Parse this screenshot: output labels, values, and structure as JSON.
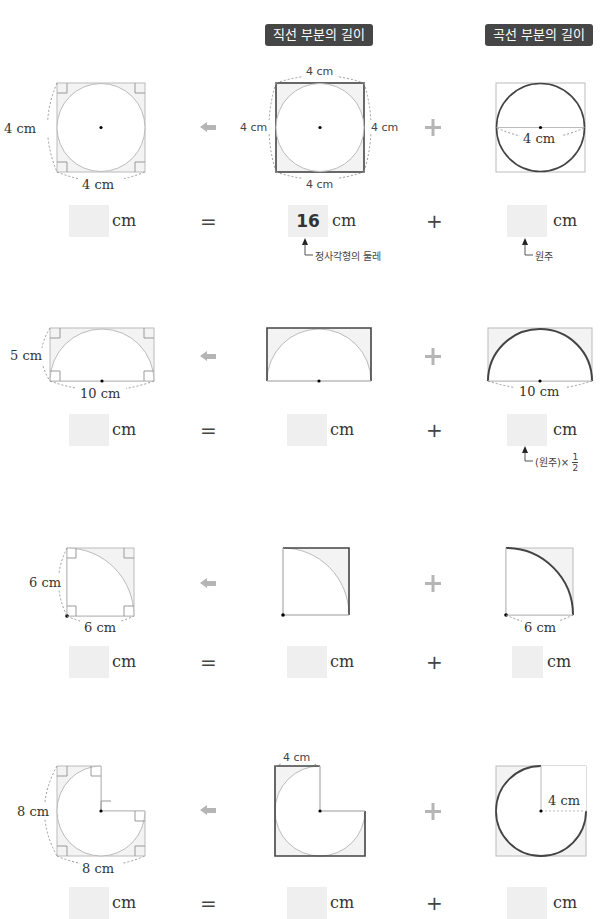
{
  "headers": {
    "straight": "직선 부분의 길이",
    "curved": "곡선 부분의 길이"
  },
  "rows": [
    {
      "shape": "circle-in-square",
      "labels": {
        "left_side": "4 cm",
        "left_bottom": "4 cm",
        "mid_top": "4 cm",
        "mid_left": "4 cm",
        "mid_right": "4 cm",
        "mid_bottom": "4 cm",
        "right_diameter": "4 cm"
      },
      "answer": {
        "total": "",
        "straight": "16",
        "curved": "",
        "unit": "cm"
      },
      "notes": {
        "straight": "정사각형의 둘레",
        "curved": "원주"
      }
    },
    {
      "shape": "semicircle-in-rectangle",
      "labels": {
        "left_side": "5 cm",
        "left_bottom": "10 cm",
        "right_diameter": "10 cm"
      },
      "answer": {
        "total": "",
        "straight": "",
        "curved": "",
        "unit": "cm"
      },
      "notes": {
        "curved_prefix": "(원주)×",
        "curved_num": "1",
        "curved_den": "2"
      }
    },
    {
      "shape": "quarter-circle-in-square",
      "labels": {
        "left_side": "6 cm",
        "left_bottom": "6 cm",
        "right_radius": "6 cm"
      },
      "answer": {
        "total": "",
        "straight": "",
        "curved": "",
        "unit": "cm"
      }
    },
    {
      "shape": "three-quarter-circle-in-l-shape",
      "labels": {
        "left_side": "8 cm",
        "left_bottom": "8 cm",
        "mid_top": "4 cm",
        "right_radius": "4 cm"
      },
      "answer": {
        "total": "",
        "straight": "",
        "curved": "",
        "unit": "cm"
      }
    }
  ],
  "operators": {
    "equals": "=",
    "plus": "+"
  },
  "icons": {
    "arrow": "left-arrow-icon",
    "plus": "plus-icon"
  },
  "colors": {
    "tag_bg": "#464646",
    "answer_box": "#efefef",
    "shape_fill": "#f3f3f3",
    "thin_line": "#bbbbbb",
    "thick_line": "#444444",
    "gray_symbol": "#b0b0b0"
  }
}
